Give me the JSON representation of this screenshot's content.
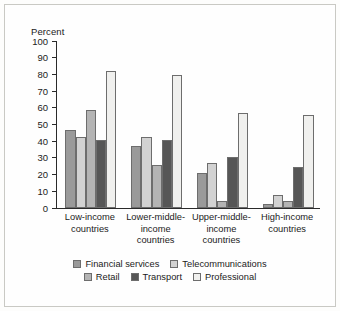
{
  "chart_data": {
    "type": "bar",
    "title": "",
    "subtitle": "",
    "xlabel": "",
    "ylabel": "Percent",
    "ylim": [
      0,
      100
    ],
    "yticks": [
      100,
      90,
      80,
      70,
      60,
      50,
      40,
      30,
      20,
      10,
      0
    ],
    "grid": false,
    "legend_position": "bottom",
    "categories": [
      "Low-income countries",
      "Lower-middle-income countries",
      "Upper-middle-income countries",
      "High-income countries"
    ],
    "category_lines": [
      [
        "Low-income",
        "countries"
      ],
      [
        "Lower-middle-",
        "income",
        "countries"
      ],
      [
        "Upper-middle-",
        "income",
        "countries"
      ],
      [
        "High-income",
        "countries"
      ]
    ],
    "series": [
      {
        "name": "Financial services",
        "color": "#9a9a9a",
        "values": [
          46.5,
          37.0,
          21.0,
          2.5
        ]
      },
      {
        "name": "Telecommunications",
        "color": "#d2d2d2",
        "values": [
          42.5,
          42.5,
          27.0,
          7.5
        ]
      },
      {
        "name": "Retail",
        "color": "#b4b4b4",
        "values": [
          58.5,
          25.5,
          4.5,
          4.5
        ]
      },
      {
        "name": "Transport",
        "color": "#565656",
        "values": [
          41.0,
          40.5,
          30.5,
          24.5
        ]
      },
      {
        "name": "Professional",
        "color": "#f0f0ee",
        "values": [
          82.0,
          79.5,
          57.0,
          55.5
        ]
      }
    ]
  },
  "legend": {
    "row1": [
      "Financial services",
      "Telecommunications"
    ],
    "row2": [
      "Retail",
      "Transport",
      "Professional"
    ]
  }
}
